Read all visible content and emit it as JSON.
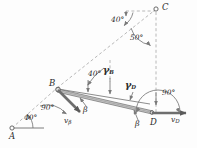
{
  "figure": {
    "background": "#fdfdfd",
    "width": 197,
    "height": 148,
    "line_color": "#6e6e6e",
    "dash_color": "#9a9a9a",
    "text_color": "#2b2b2b",
    "bar_fill": "#bdbdbd"
  },
  "points": [
    {
      "id": "A",
      "label": "A",
      "x": 12,
      "y": 128
    },
    {
      "id": "B",
      "label": "B",
      "x": 57,
      "y": 88
    },
    {
      "id": "C",
      "label": "C",
      "x": 156,
      "y": 9
    },
    {
      "id": "D",
      "label": "D",
      "x": 152,
      "y": 113
    }
  ],
  "point_labels": {
    "A": "A",
    "B": "B",
    "C": "C",
    "D": "D"
  },
  "angles": [
    {
      "id": "angle-at-A",
      "value": "40",
      "unit": "°",
      "x": 28,
      "y": 118
    },
    {
      "id": "angle-at-B-90",
      "value": "90",
      "unit": "°",
      "x": 45,
      "y": 108
    },
    {
      "id": "angle-at-B-40",
      "value": "40",
      "unit": "°",
      "x": 92,
      "y": 73
    },
    {
      "id": "angle-at-C-40",
      "value": "40",
      "unit": "°",
      "x": 115,
      "y": 19
    },
    {
      "id": "angle-at-C-50",
      "value": "50",
      "unit": "°",
      "x": 134,
      "y": 37
    },
    {
      "id": "angle-at-D-90",
      "value": "90",
      "unit": "°",
      "x": 166,
      "y": 93
    }
  ],
  "vectors": [
    {
      "id": "v-beta",
      "base": "v",
      "sub": "β",
      "x": 70,
      "y": 120
    },
    {
      "id": "v-D",
      "base": "v",
      "sub": "D",
      "x": 174,
      "y": 119
    }
  ],
  "greek_labels": [
    {
      "id": "gamma-B",
      "base": "γ",
      "sub": "B",
      "x": 107,
      "y": 71
    },
    {
      "id": "gamma-D",
      "base": "γ",
      "sub": "D",
      "x": 129,
      "y": 86
    },
    {
      "id": "beta-upper",
      "base": "β",
      "sub": "",
      "x": 85,
      "y": 110
    },
    {
      "id": "beta-lower",
      "base": "β",
      "sub": "",
      "x": 137,
      "y": 124
    }
  ]
}
